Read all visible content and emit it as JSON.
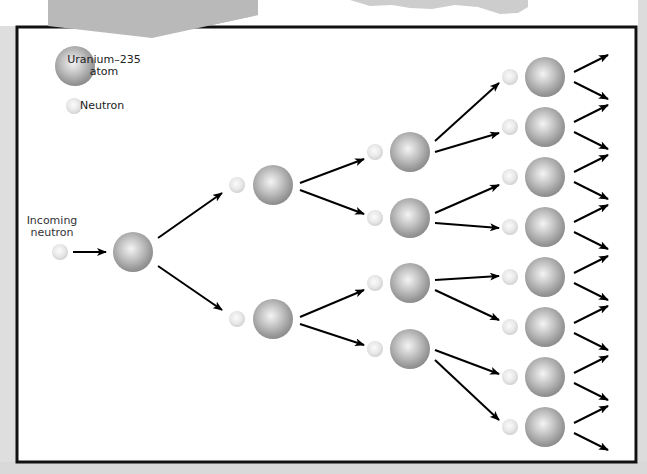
{
  "legend": {
    "uranium_label_line1": "Uranium–235",
    "uranium_label_line2": "atom",
    "neutron_label": "Neutron"
  },
  "incoming": {
    "label_line1": "Incoming",
    "label_line2": "neutron"
  },
  "colors": {
    "frame": "#111111",
    "banner_gray": "#b8b8b8",
    "banner_light": "#cfcfcf",
    "atom_base": "#9a9a9a",
    "atom_highlight": "#f2f2f2",
    "neutron_base": "#d6d6d6",
    "arrow": "#000000"
  },
  "structure": {
    "generations": [
      {
        "gen": 0,
        "neutrons": 1,
        "atoms": 1
      },
      {
        "gen": 1,
        "neutrons": 2,
        "atoms": 2
      },
      {
        "gen": 2,
        "neutrons": 4,
        "atoms": 4
      },
      {
        "gen": 3,
        "neutrons": 8,
        "atoms": 8
      },
      {
        "gen": 4,
        "neutrons_out": 16
      }
    ]
  }
}
